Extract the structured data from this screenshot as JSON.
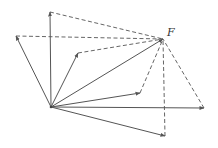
{
  "diagram": {
    "resultant_label": "F",
    "colors": {
      "line": "#555555",
      "label": "#333333",
      "background": "#ffffff"
    },
    "origin": {
      "x": 51,
      "y": 107
    },
    "resultant": {
      "x": 163,
      "y": 39
    },
    "components": [
      {
        "name": "vertical",
        "tip": {
          "x": 50,
          "y": 12
        }
      },
      {
        "name": "upper-left",
        "tip": {
          "x": 16,
          "y": 36
        }
      },
      {
        "name": "upper-mid",
        "tip": {
          "x": 78,
          "y": 53
        }
      },
      {
        "name": "right-mid",
        "tip": {
          "x": 140,
          "y": 93
        }
      },
      {
        "name": "horizontal",
        "tip": {
          "x": 204,
          "y": 108
        }
      },
      {
        "name": "lower-right",
        "tip": {
          "x": 165,
          "y": 136
        }
      }
    ]
  }
}
